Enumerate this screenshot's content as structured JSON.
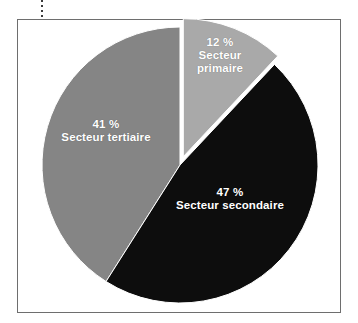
{
  "page": {
    "title_fragment": "",
    "background": "#ffffff",
    "frame_border_color": "#6e6e6e"
  },
  "chart_data": {
    "type": "pie",
    "title": "",
    "subtitle": "",
    "xlabel": "",
    "ylabel": "",
    "legend_position": "none",
    "grid": false,
    "unit": "%",
    "total": 100,
    "categories": [
      "Secteur primaire",
      "Secteur secondaire",
      "Secteur tertiaire"
    ],
    "values": [
      12,
      47,
      41
    ],
    "colors": [
      "#a9a9a9",
      "#0d0d0d",
      "#858585"
    ],
    "exploded": [
      "Secteur primaire"
    ],
    "slices": [
      {
        "name": "Secteur primaire",
        "value": 12,
        "percent_label": "12 %",
        "color": "#a9a9a9",
        "label_color": "#ffffff",
        "exploded": true,
        "start_angle_deg": 0,
        "end_angle_deg": 43.2
      },
      {
        "name": "Secteur secondaire",
        "value": 47,
        "percent_label": "47 %",
        "color": "#0d0d0d",
        "label_color": "#ffffff",
        "exploded": false,
        "start_angle_deg": 43.2,
        "end_angle_deg": 212.4
      },
      {
        "name": "Secteur tertiaire",
        "value": 41,
        "percent_label": "41 %",
        "color": "#858585",
        "label_color": "#ffffff",
        "exploded": false,
        "start_angle_deg": 212.4,
        "end_angle_deg": 360
      }
    ]
  },
  "labels": {
    "primary": {
      "percent": "12 %",
      "name_line1": "Secteur",
      "name_line2": "primaire"
    },
    "secondary": {
      "percent": "47 %",
      "name": "Secteur secondaire"
    },
    "tertiary": {
      "percent": "41 %",
      "name": "Secteur tertiaire"
    }
  }
}
